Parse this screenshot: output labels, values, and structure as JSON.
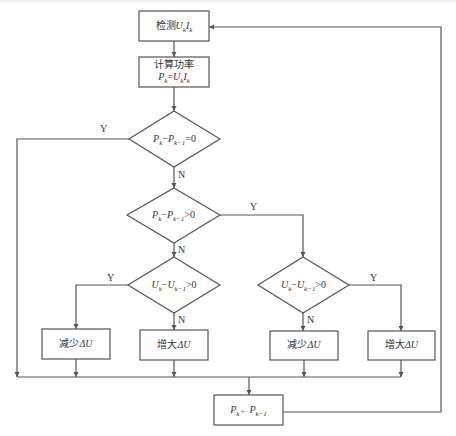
{
  "diagram": {
    "type": "flowchart",
    "colors": {
      "line": "#555555",
      "border": "#555555",
      "text": "#333333",
      "background": "#ffffff"
    },
    "nodes": {
      "detect": {
        "type": "process",
        "line1": "检测",
        "var": "U",
        "sub1": "k",
        "var2": "I",
        "sub2": "k"
      },
      "compute": {
        "type": "process",
        "line1": "计算功率",
        "formula": "P",
        "sub": "k",
        "eq": "=",
        "u": "U",
        "usub": "k",
        "i": "I",
        "isub": "k"
      },
      "cond_p_eq": {
        "type": "decision",
        "text_p": "P",
        "sub_k": "k",
        "minus": "−",
        "text_p2": "P",
        "sub_k1": "k−1",
        "op": "=0"
      },
      "cond_p_gt": {
        "type": "decision",
        "text_p": "P",
        "sub_k": "k",
        "minus": "−",
        "text_p2": "P",
        "sub_k1": "k−1",
        "op": ">0"
      },
      "cond_u_left": {
        "type": "decision",
        "text_u": "U",
        "sub_k": "k",
        "minus": "−",
        "text_u2": "U",
        "sub_k1": "k−1",
        "op": ">0"
      },
      "cond_u_right": {
        "type": "decision",
        "text_u": "U",
        "sub_k": "k",
        "minus": "−",
        "text_u2": "U",
        "sub_k1": "k−1",
        "op": ">0"
      },
      "dec_left": {
        "type": "process",
        "label": "减少",
        "delta": "ΔU"
      },
      "inc_left": {
        "type": "process",
        "label": "增大",
        "delta": "ΔU"
      },
      "dec_right": {
        "type": "process",
        "label": "减少",
        "delta": "ΔU"
      },
      "inc_right": {
        "type": "process",
        "label": "增大",
        "delta": "ΔU"
      },
      "update": {
        "type": "process",
        "p": "P",
        "sub_k": "k",
        "arrow": "←",
        "p2": "P",
        "sub_k1": "k−1"
      }
    },
    "edge_labels": {
      "p_eq_yes": "Y",
      "p_eq_no": "N",
      "p_gt_yes": "Y",
      "p_gt_no": "N",
      "u_left_yes": "Y",
      "u_left_no": "N",
      "u_right_yes": "Y",
      "u_right_no": "N"
    }
  }
}
